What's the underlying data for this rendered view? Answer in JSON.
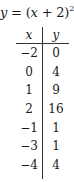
{
  "title": {
    "lhs": "y",
    "eq": " = (",
    "var": "x",
    "rest": " + 2)",
    "exponent": "2"
  },
  "table": {
    "headers": {
      "x": "x",
      "y": "y"
    },
    "rows": [
      {
        "x": "−2",
        "y": "0"
      },
      {
        "x": "0",
        "y": "4"
      },
      {
        "x": "1",
        "y": "9"
      },
      {
        "x": "2",
        "y": "16"
      },
      {
        "x": "−1",
        "y": "1"
      },
      {
        "x": "−3",
        "y": "1"
      },
      {
        "x": "−4",
        "y": "4"
      }
    ]
  }
}
